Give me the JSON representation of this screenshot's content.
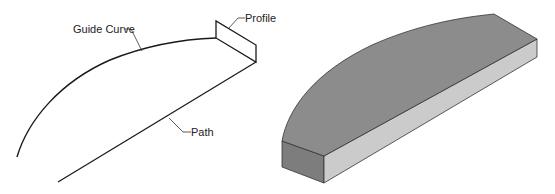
{
  "figure": {
    "left_panel": {
      "title": "Sweep wireframe",
      "labels": {
        "guide_curve": "Guide Curve",
        "profile": "Profile",
        "path": "Path"
      }
    },
    "right_panel": {
      "title": "Swept solid result"
    },
    "colors": {
      "line": "#1a1a1a",
      "top_face": "#8a8a8a",
      "front_face": "#c8c8c8",
      "end_face": "#7a7a7a",
      "background": "#ffffff"
    }
  }
}
